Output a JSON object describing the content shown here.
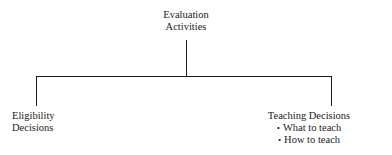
{
  "diagram": {
    "type": "organizational-tree",
    "root": {
      "lines": [
        "Evaluation",
        "Activities"
      ]
    },
    "branches": [
      {
        "id": "eligibility",
        "lines": [
          "Eligibility",
          "Decisions"
        ],
        "bullets": []
      },
      {
        "id": "teaching",
        "heading": "Teaching Decisions",
        "bullets": [
          "What to teach",
          "How to teach"
        ]
      }
    ],
    "bullet_glyph": "•",
    "colors": {
      "background": "#ffffff",
      "text": "#1a1a1a",
      "line": "#1d1d1d"
    }
  }
}
